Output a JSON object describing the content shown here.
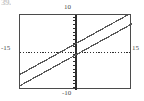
{
  "artifact": {
    "text": "39."
  },
  "window_labels": {
    "ymax": "10",
    "ymin": "-10",
    "xmin": "-15",
    "xmax": "15"
  },
  "colors": {
    "frame": "#4b4b4b",
    "axis": "#2e2e2e",
    "line": "#5a5a5a",
    "background": "#ffffff",
    "label": "#4a4a4a"
  },
  "chart_data": {
    "type": "line",
    "title": "",
    "xlabel": "",
    "ylabel": "",
    "xlim": [
      -15,
      15
    ],
    "ylim": [
      -10,
      10
    ],
    "grid": false,
    "axis_style": "dotted-with-ticks",
    "legend": "none",
    "x_tick_step": 1,
    "y_tick_step": 1,
    "series": [
      {
        "name": "line-upper",
        "slope": 0.55,
        "intercept": 2.4,
        "x": [
          -15,
          15
        ],
        "values": [
          -5.85,
          10.65
        ]
      },
      {
        "name": "line-lower",
        "slope": 0.55,
        "intercept": -0.6,
        "x": [
          -15,
          15
        ],
        "values": [
          -8.85,
          7.65
        ]
      }
    ]
  }
}
